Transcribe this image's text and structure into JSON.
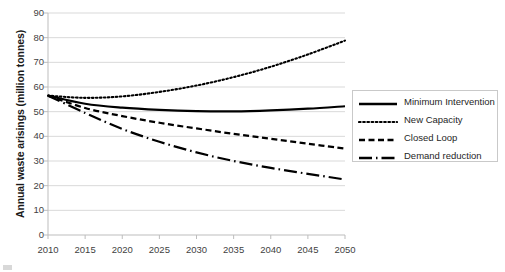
{
  "chart_data": {
    "type": "line",
    "title": "",
    "xlabel": "",
    "ylabel": "Annual waste arisings (million tonnes)",
    "xlim": [
      2010,
      2050
    ],
    "ylim": [
      0,
      90
    ],
    "ytick_step": 10,
    "xticks": [
      2010,
      2015,
      2020,
      2025,
      2030,
      2035,
      2040,
      2045,
      2050
    ],
    "yticks": [
      0,
      10,
      20,
      30,
      40,
      50,
      60,
      70,
      80,
      90
    ],
    "grid": "horizontal",
    "legend_position": "right",
    "x": [
      2010,
      2015,
      2020,
      2025,
      2030,
      2035,
      2040,
      2045,
      2050
    ],
    "series": [
      {
        "name": "Minimum Intervention",
        "style": "solid",
        "color": "#000000",
        "values": [
          56.5,
          53.2,
          51.6,
          50.7,
          50.2,
          50.1,
          50.5,
          51.2,
          52.2
        ]
      },
      {
        "name": "New Capacity",
        "style": "dotted",
        "color": "#000000",
        "values": [
          56.5,
          55.6,
          56.2,
          58.0,
          60.6,
          64.0,
          68.2,
          73.2,
          78.8
        ]
      },
      {
        "name": "Closed Loop",
        "style": "dashed",
        "color": "#000000",
        "values": [
          56.5,
          51.5,
          48.2,
          45.5,
          43.2,
          41.0,
          39.0,
          37.0,
          35.0
        ]
      },
      {
        "name": "Demand reduction",
        "style": "dash-dot",
        "color": "#000000",
        "values": [
          56.5,
          49.5,
          43.0,
          37.8,
          33.5,
          30.0,
          27.2,
          24.8,
          22.5
        ]
      }
    ]
  },
  "legend": {
    "items": [
      {
        "label": "Minimum Intervention",
        "style": "solid"
      },
      {
        "label": "New Capacity",
        "style": "dotted"
      },
      {
        "label": "Closed Loop",
        "style": "dashed"
      },
      {
        "label": "Demand reduction",
        "style": "dash-dot"
      }
    ]
  }
}
